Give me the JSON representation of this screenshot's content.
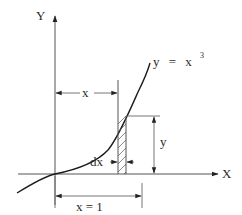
{
  "diagram": {
    "axes": {
      "y_label": "Y",
      "x_label": "X"
    },
    "curve": {
      "equation_lhs": "y",
      "equation_eq": "=",
      "equation_base": "x",
      "equation_exp": "3",
      "equation_text": "y = x³"
    },
    "dimensions": {
      "x_marker": "x",
      "y_marker": "y",
      "dx_marker": "dx",
      "x_equals_one": "x = 1"
    },
    "strip": {
      "description": "hatched vertical strip of width dx under the curve"
    },
    "colors": {
      "line": "#1c1c1c",
      "axis": "#555555",
      "background": "#ffffff"
    }
  }
}
